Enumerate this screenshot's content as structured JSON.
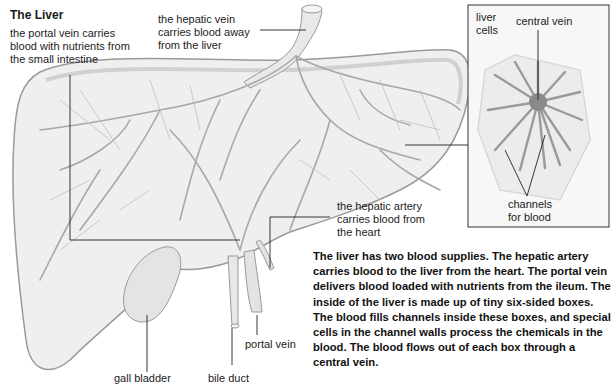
{
  "title": "The Liver",
  "labels": {
    "portal_vein_top": [
      "the portal vein carries",
      "blood with nutrients from",
      "the small intestine"
    ],
    "hepatic_vein": [
      "the hepatic vein",
      "carries blood away",
      "from the liver"
    ],
    "hepatic_artery": [
      "the hepatic artery",
      "carries blood from",
      "the heart"
    ],
    "gall_bladder": "gall bladder",
    "bile_duct": "bile duct",
    "portal_vein_bottom": "portal vein"
  },
  "inset": {
    "liver_cells": [
      "liver",
      "cells"
    ],
    "central_vein": "central vein",
    "channels": [
      "channels",
      "for blood"
    ]
  },
  "description": "The liver has two blood supplies. The hepatic artery carries blood to the liver from the heart. The portal vein delivers blood loaded with nutrients from the ileum. The inside of the liver is made up of tiny six-sided boxes. The blood fills channels inside these boxes, and special cells in the channel walls process the chemicals in the blood. The blood flows out of each box through a central vein."
}
